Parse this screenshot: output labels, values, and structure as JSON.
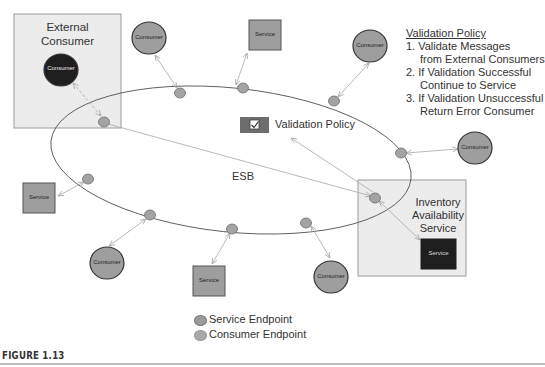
{
  "figure": {
    "caption": "FIGURE 1.13"
  },
  "bus": {
    "label": "ESB"
  },
  "external_consumer": {
    "title_line1": "External",
    "title_line2": "Consumer",
    "node_label": "Consumer"
  },
  "inventory_service": {
    "title_line1": "Inventory",
    "title_line2": "Availability",
    "title_line3": "Service",
    "node_label": "Service"
  },
  "validation_policy_node": {
    "label": "Validation Policy",
    "icon": "checkbox-icon"
  },
  "policy_panel": {
    "title": "Validation Policy",
    "lines": [
      "1. Validate Messages",
      "from External Consumers",
      "2. If Validation Successful",
      "Continue to Service",
      "3. If Validation Unsuccessful",
      "Return Error Consumer"
    ]
  },
  "nodes": {
    "consumer_top_left": "Consumer",
    "service_top": "Service",
    "consumer_top_right": "Consumer",
    "consumer_right": "Consumer",
    "service_left": "Service",
    "consumer_bottom_left": "Consumer",
    "service_bottom": "Service",
    "consumer_bottom": "Consumer"
  },
  "legend": {
    "items": [
      {
        "label": "Service Endpoint",
        "color": "#9a9a9a"
      },
      {
        "label": "Consumer Endpoint",
        "color": "#a8a8a8"
      }
    ]
  },
  "colors": {
    "box_fill": "#ececec",
    "box_border": "#9a9a9a",
    "node_fill": "#9e9e9e",
    "dark_node_fill": "#1e1e1e",
    "endpoint_fill": "#a3a3a3",
    "connector": "#b0b0b0",
    "ellipse_stroke": "#555555",
    "policy_icon_fill": "#6d6d6d"
  }
}
